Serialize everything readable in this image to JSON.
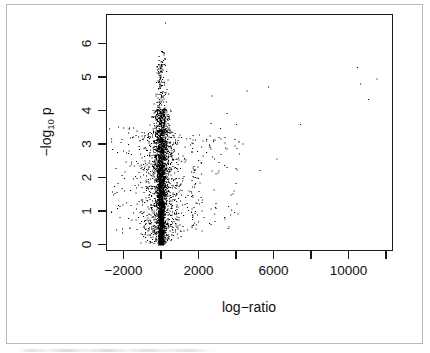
{
  "figure": {
    "background_color": "#ffffff",
    "frame_color": "#b9b9b9",
    "point_color": "#000000",
    "axis_color": "#1a1a1a"
  },
  "chart_data": {
    "type": "scatter",
    "title": "",
    "xlabel": "log−ratio",
    "ylabel": "−log",
    "ylabel_sub": "10",
    "ylabel_tail": "p",
    "xlim": [
      -3000,
      11800
    ],
    "ylim": [
      -0.15,
      6.8
    ],
    "grid": false,
    "legend": null,
    "xticks": [
      -2000,
      0,
      2000,
      4000,
      6000,
      8000,
      10000,
      12000
    ],
    "xticklabels": [
      "-2000",
      "",
      "2000",
      "",
      "6000",
      "",
      "10000",
      ""
    ],
    "xticklabels_display": [
      "−2000",
      "2000",
      "6000",
      "10000"
    ],
    "yticks": [
      0,
      1,
      2,
      3,
      4,
      5,
      6
    ],
    "yticklabels": [
      "0",
      "1",
      "2",
      "3",
      "4",
      "5",
      "6"
    ],
    "marker": "point",
    "marker_size": 1,
    "n_points_approx": 4200,
    "outliers": [
      {
        "x": 11500,
        "y": 4.95
      },
      {
        "x": 10450,
        "y": 5.3
      },
      {
        "x": 10600,
        "y": 4.8
      },
      {
        "x": 11050,
        "y": 4.35
      },
      {
        "x": 7400,
        "y": 3.6
      },
      {
        "x": 6150,
        "y": 2.57
      },
      {
        "x": 5700,
        "y": 4.72
      },
      {
        "x": 5250,
        "y": 2.22
      },
      {
        "x": 4550,
        "y": 4.6
      },
      {
        "x": 4350,
        "y": 3.02
      },
      {
        "x": 4150,
        "y": 2.72
      },
      {
        "x": 4000,
        "y": 3.6
      },
      {
        "x": 3500,
        "y": 3.92
      },
      {
        "x": 3150,
        "y": 3.48
      },
      {
        "x": 2700,
        "y": 4.45
      },
      {
        "x": 2650,
        "y": 3.62
      },
      {
        "x": 2550,
        "y": 2.98
      },
      {
        "x": 200,
        "y": 6.62
      }
    ],
    "max_neglog10p": 6.62,
    "min_logratio": -2700,
    "max_logratio": 11500
  }
}
